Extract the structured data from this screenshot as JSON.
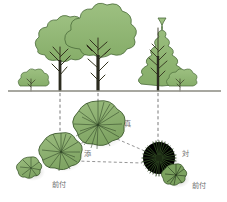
{
  "figure": {
    "background_color": "#ffffff"
  },
  "palette": {
    "canopy_fill": "#8fb673",
    "canopy_fill_dark": "#7ea563",
    "canopy_stroke": "#4a6b3a",
    "plan_fill": "#8aae6c",
    "plan_fill_alt": "#96b97a",
    "plan_stroke": "#3f5c30",
    "conifer_plan_fill": "#3d5a2c",
    "conifer_plan_stroke": "#22331a",
    "trunk_color": "#2b2b1f",
    "branch_color": "#3a3a28",
    "ground_line": "#8a8a80",
    "dash_line": "#6b6b6b",
    "label_text": "#6e6e6e",
    "shadow": "#b9b9b4"
  },
  "ground": {
    "label": "ground-line",
    "y": 91,
    "x_start": 8,
    "x_end": 221
  },
  "elevation_trees": [
    {
      "id": "shrub-far-left",
      "type": "small-shrub",
      "label": "",
      "cx": 31,
      "cy": 83,
      "rx": 13,
      "ry": 8,
      "trunk_height": 10
    },
    {
      "id": "tree-left-deciduous",
      "type": "deciduous-broadleaf",
      "label": "添",
      "cx": 60,
      "cy": 48,
      "rx": 27,
      "ry": 22,
      "trunk_height": 44
    },
    {
      "id": "tree-center-deciduous",
      "type": "deciduous-broadleaf",
      "label": "真",
      "cx": 98,
      "cy": 40,
      "rx": 33,
      "ry": 27,
      "trunk_height": 52
    },
    {
      "id": "tree-right-conifer",
      "type": "conifer-evergreen",
      "label": "対",
      "cx": 158,
      "cy": 50,
      "rx": 16,
      "ry": 31,
      "trunk_height": 42
    },
    {
      "id": "shrub-far-right",
      "type": "small-shrub",
      "label": "前付",
      "cx": 180,
      "cy": 83,
      "rx": 13,
      "ry": 8,
      "trunk_height": 9
    }
  ],
  "plan_symbols": [
    {
      "id": "plan-shrub-left",
      "symbol": "radial-broadleaf-small",
      "cx": 31,
      "cy": 168,
      "r": 11,
      "label": "前付",
      "label_x": 52,
      "label_y": 186
    },
    {
      "id": "plan-tree-left",
      "symbol": "radial-broadleaf",
      "cx": 61,
      "cy": 152,
      "r": 19,
      "label": "添",
      "label_x": 84,
      "label_y": 155
    },
    {
      "id": "plan-tree-center",
      "symbol": "radial-broadleaf-large",
      "cx": 98,
      "cy": 125,
      "r": 24,
      "label": "真",
      "label_x": 124,
      "label_y": 126
    },
    {
      "id": "plan-tree-right-conifer",
      "symbol": "spiky-conifer",
      "cx": 159,
      "cy": 158,
      "r": 17,
      "label": "対",
      "label_x": 182,
      "label_y": 155
    },
    {
      "id": "plan-shrub-right",
      "symbol": "radial-broadleaf-small",
      "cx": 176,
      "cy": 175,
      "r": 11,
      "label": "前付",
      "label_x": 193,
      "label_y": 187
    }
  ],
  "labels": [
    {
      "id": "label-shin",
      "text": "真",
      "x": 124,
      "y": 126
    },
    {
      "id": "label-soe",
      "text": "添",
      "x": 84,
      "y": 155
    },
    {
      "id": "label-tai",
      "text": "対",
      "x": 182,
      "y": 155
    },
    {
      "id": "label-maezuke-l",
      "text": "前付",
      "x": 52,
      "y": 186
    },
    {
      "id": "label-maezuke-r",
      "text": "前付",
      "x": 193,
      "y": 187
    }
  ],
  "projection_lines": [
    {
      "id": "proj-left",
      "x1": 60,
      "y1": 93,
      "x2": 60,
      "y2": 133
    },
    {
      "id": "proj-center",
      "x1": 98,
      "y1": 93,
      "x2": 98,
      "y2": 101
    },
    {
      "id": "proj-right",
      "x1": 158,
      "y1": 93,
      "x2": 158,
      "y2": 141
    }
  ],
  "relation_lines": [
    {
      "id": "rel-center-to-conifer",
      "x1": 117,
      "y1": 138,
      "x2": 146,
      "y2": 153
    },
    {
      "id": "rel-center-to-left",
      "x1": 82,
      "y1": 140,
      "x2": 72,
      "y2": 148
    },
    {
      "id": "rel-left-to-conifer",
      "x1": 74,
      "y1": 160,
      "x2": 143,
      "y2": 162
    }
  ]
}
